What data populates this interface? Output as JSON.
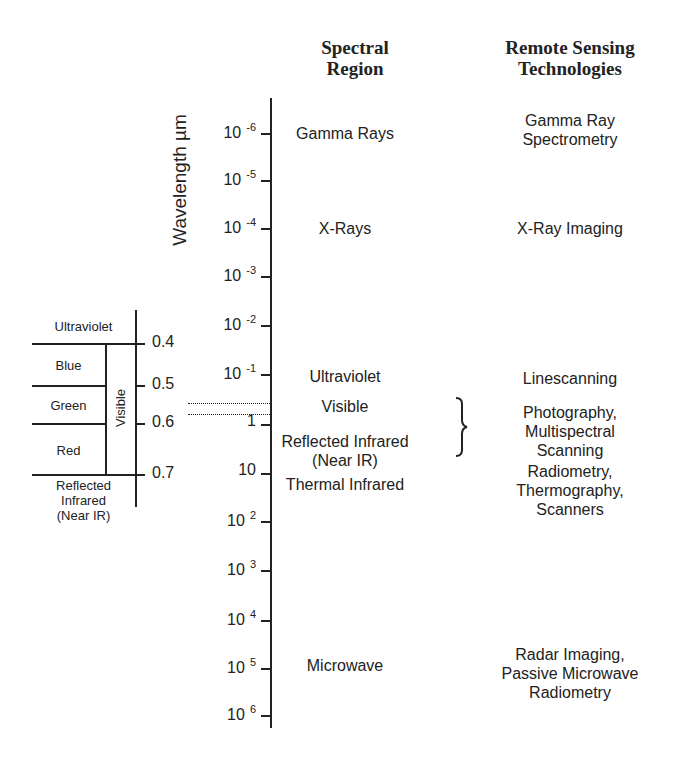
{
  "headers": {
    "spectral_region": [
      "Spectral",
      "Region"
    ],
    "technologies": [
      "Remote Sensing",
      "Technologies"
    ]
  },
  "axis": {
    "label": "Wavelength µm",
    "ticks": [
      {
        "base": "10",
        "exp": "-6",
        "y": 133
      },
      {
        "base": "10",
        "exp": "-5",
        "y": 180
      },
      {
        "base": "10",
        "exp": "-4",
        "y": 228
      },
      {
        "base": "10",
        "exp": "-3",
        "y": 276
      },
      {
        "base": "10",
        "exp": "-2",
        "y": 325
      },
      {
        "base": "10",
        "exp": "-1",
        "y": 374
      },
      {
        "base": "1",
        "exp": "",
        "y": 424
      },
      {
        "base": "10",
        "exp": "",
        "y": 473
      },
      {
        "base": "10",
        "exp": "2",
        "y": 521
      },
      {
        "base": "10",
        "exp": "3",
        "y": 570
      },
      {
        "base": "10",
        "exp": "4",
        "y": 620
      },
      {
        "base": "10",
        "exp": "5",
        "y": 668
      },
      {
        "base": "10",
        "exp": "6",
        "y": 715
      }
    ]
  },
  "regions": [
    {
      "name": "Gamma Rays",
      "y": 124
    },
    {
      "name": "X-Rays",
      "y": 219
    },
    {
      "name": "Ultraviolet",
      "y": 367
    },
    {
      "name": "Visible",
      "y": 397
    },
    {
      "name": "Reflected Infrared",
      "y": 432
    },
    {
      "name": "(Near IR)",
      "y": 451
    },
    {
      "name": "Thermal Infrared",
      "y": 475
    },
    {
      "name": "Microwave",
      "y": 656
    }
  ],
  "technologies": [
    {
      "lines": [
        "Gamma Ray",
        "Spectrometry"
      ],
      "y": 111
    },
    {
      "lines": [
        "X-Ray Imaging"
      ],
      "y": 219
    },
    {
      "lines": [
        "Linescanning"
      ],
      "y": 369
    },
    {
      "lines": [
        "Photography,",
        "Multispectral",
        "Scanning"
      ],
      "y": 403
    },
    {
      "lines": [
        "Radiometry,",
        "Thermography,",
        "Scanners"
      ],
      "y": 462
    },
    {
      "lines": [
        "Radar Imaging,",
        "Passive Microwave",
        "Radiometry"
      ],
      "y": 645
    }
  ],
  "visible_inset": {
    "bands": [
      {
        "name": "Ultraviolet",
        "y": 319
      },
      {
        "name": "Blue",
        "y": 358
      },
      {
        "name": "Green",
        "y": 398
      },
      {
        "name": "Red",
        "y": 443
      }
    ],
    "near_ir": [
      "Reflected",
      "Infrared",
      "(Near IR)"
    ],
    "visible_label": "Visible",
    "values": [
      {
        "v": "0.4",
        "y": 333
      },
      {
        "v": "0.5",
        "y": 375
      },
      {
        "v": "0.6",
        "y": 413
      },
      {
        "v": "0.7",
        "y": 464
      }
    ]
  }
}
